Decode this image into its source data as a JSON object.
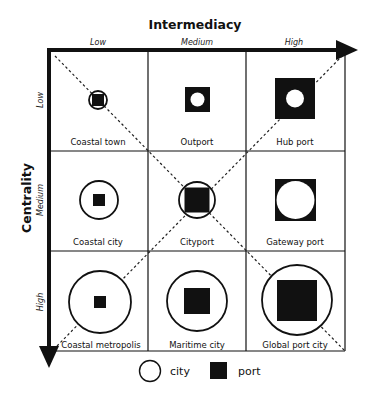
{
  "x_axis": {
    "title": "Intermediacy",
    "ticks": [
      "Low",
      "Medium",
      "High"
    ]
  },
  "y_axis": {
    "title": "Centrality",
    "ticks": [
      "Low",
      "Medium",
      "High"
    ]
  },
  "cells": [
    {
      "row": 0,
      "col": 0,
      "label": "Coastal town",
      "city_radius": 9,
      "port_size": 12,
      "layer_order": "city-under-port"
    },
    {
      "row": 0,
      "col": 1,
      "label": "Outport",
      "city_radius": 7,
      "port_size": 25,
      "layer_order": "city-over-port"
    },
    {
      "row": 0,
      "col": 2,
      "label": "Hub port",
      "city_radius": 9,
      "port_size": 40,
      "layer_order": "city-over-port"
    },
    {
      "row": 1,
      "col": 0,
      "label": "Coastal city",
      "city_radius": 19,
      "port_size": 12,
      "layer_order": "city-under-port"
    },
    {
      "row": 1,
      "col": 1,
      "label": "Cityport",
      "city_radius": 18,
      "port_size": 25,
      "layer_order": "city-under-port"
    },
    {
      "row": 1,
      "col": 2,
      "label": "Gateway port",
      "city_radius": 19,
      "port_size": 41,
      "layer_order": "city-over-port"
    },
    {
      "row": 2,
      "col": 0,
      "label": "Coastal metropolis",
      "city_radius": 31,
      "port_size": 12,
      "layer_order": "city-under-port"
    },
    {
      "row": 2,
      "col": 1,
      "label": "Maritime city",
      "city_radius": 30,
      "port_size": 26,
      "layer_order": "city-under-port"
    },
    {
      "row": 2,
      "col": 2,
      "label": "Global port city",
      "city_radius": 35,
      "port_size": 40,
      "layer_order": "city-under-port"
    }
  ],
  "legend": {
    "city_label": "city",
    "port_label": "port"
  },
  "colors": {
    "ink": "#111111",
    "background": "#ffffff"
  }
}
